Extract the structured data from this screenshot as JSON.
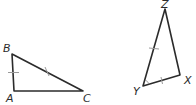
{
  "diagram": {
    "type": "congruent-triangles",
    "colors": {
      "stroke": "#2b2b2b",
      "tick": "#9a9a9a"
    },
    "triangles": [
      {
        "name": "ABC",
        "vertices": {
          "A": {
            "label": "A",
            "x": 14,
            "y": 91,
            "lx": 6,
            "ly": 102
          },
          "B": {
            "label": "B",
            "x": 12,
            "y": 54,
            "lx": 3,
            "ly": 52
          },
          "C": {
            "label": "C",
            "x": 83,
            "y": 91,
            "lx": 83,
            "ly": 102
          }
        },
        "tick_marks": [
          {
            "side": "AB",
            "count": 1
          },
          {
            "side": "BC",
            "count": 1
          }
        ]
      },
      {
        "name": "XYZ",
        "vertices": {
          "X": {
            "label": "X",
            "x": 180,
            "y": 75,
            "lx": 184,
            "ly": 84
          },
          "Y": {
            "label": "Y",
            "x": 143,
            "y": 86,
            "lx": 133,
            "ly": 95
          },
          "Z": {
            "label": "Z",
            "x": 165,
            "y": 9,
            "lx": 161,
            "ly": 8
          }
        },
        "tick_marks": [
          {
            "side": "ZY",
            "count": 1
          },
          {
            "side": "YX",
            "count": 1
          }
        ],
        "angle_marks": [
          {
            "vertex": "Y"
          }
        ]
      }
    ]
  }
}
